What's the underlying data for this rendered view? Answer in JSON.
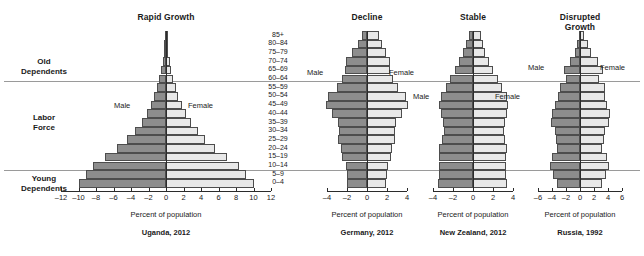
{
  "figure": {
    "age_groups": [
      "85+",
      "80–84",
      "75–79",
      "70–74",
      "65–69",
      "60–64",
      "55–59",
      "50–54",
      "45–49",
      "40–44",
      "35–39",
      "30–34",
      "25–29",
      "20–24",
      "15–19",
      "10–14",
      "5–9",
      "0–4"
    ],
    "side_labels": [
      {
        "name": "old-dependents",
        "text_line1": "Old",
        "text_line2": "Dependents"
      },
      {
        "name": "labor-force",
        "text_line1": "Labor",
        "text_line2": "Force"
      },
      {
        "name": "young-dependents",
        "text_line1": "Young",
        "text_line2": "Dependents"
      }
    ],
    "male_label": "Male",
    "female_label": "Female",
    "axis_title": "Percent of population",
    "colors": {
      "male": "#8d8d8d",
      "female": "#e8e8e8",
      "bar_border": "#4d4d4d",
      "axis": "#2b2b2b",
      "divider": "#9a9a9a"
    }
  },
  "chart_data": [
    {
      "type": "bar",
      "name": "uganda",
      "title": "Rapid Growth",
      "caption": "Uganda, 2012",
      "xlabel": "Percent of population",
      "ylabel": "",
      "categories": [
        "85+",
        "80–84",
        "75–79",
        "70–74",
        "65–69",
        "60–64",
        "55–59",
        "50–54",
        "45–49",
        "40–44",
        "35–39",
        "30–34",
        "25–29",
        "20–24",
        "15–19",
        "10–14",
        "5–9",
        "0–4"
      ],
      "xlim": [
        -12,
        12
      ],
      "xticks": [
        -12,
        -10,
        -8,
        -6,
        -4,
        -2,
        0,
        2,
        4,
        6,
        8,
        10,
        12
      ],
      "xticklabels": [
        "–12",
        "–10",
        "–8",
        "–6",
        "–4",
        "–2",
        "0",
        "2",
        "4",
        "6",
        "8",
        "10",
        "12"
      ],
      "grid": false,
      "legend": [
        "Male",
        "Female"
      ],
      "series": [
        {
          "name": "Male",
          "values": [
            0.12,
            0.18,
            0.26,
            0.38,
            0.55,
            0.78,
            1.05,
            1.35,
            1.75,
            2.2,
            2.8,
            3.55,
            4.45,
            5.6,
            6.95,
            8.3,
            9.1,
            10.0
          ]
        },
        {
          "name": "Female",
          "values": [
            0.14,
            0.2,
            0.28,
            0.4,
            0.58,
            0.82,
            1.1,
            1.4,
            1.8,
            2.25,
            2.85,
            3.6,
            4.5,
            5.65,
            7.0,
            8.35,
            9.15,
            10.05
          ]
        }
      ]
    },
    {
      "type": "bar",
      "name": "germany",
      "title": "Decline",
      "caption": "Germany, 2012",
      "xlabel": "Percent of population",
      "ylabel": "",
      "categories": [
        "85+",
        "80–84",
        "75–79",
        "70–74",
        "65–69",
        "60–64",
        "55–59",
        "50–54",
        "45–49",
        "40–44",
        "35–39",
        "30–34",
        "25–29",
        "20–24",
        "15–19",
        "10–14",
        "5–9",
        "0–4"
      ],
      "xlim": [
        -4,
        4
      ],
      "xticks": [
        -4,
        -2,
        0,
        2,
        4
      ],
      "xticklabels": [
        "–4",
        "–2",
        "0",
        "2",
        "4"
      ],
      "grid": false,
      "legend": [
        "Male",
        "Female"
      ],
      "series": [
        {
          "name": "Male",
          "values": [
            0.55,
            0.95,
            1.55,
            2.1,
            2.25,
            2.55,
            3.0,
            3.9,
            4.15,
            3.55,
            2.95,
            2.85,
            2.95,
            2.65,
            2.5,
            2.15,
            2.05,
            2.0
          ]
        },
        {
          "name": "Female",
          "values": [
            1.15,
            1.45,
            1.9,
            2.25,
            2.3,
            2.6,
            3.05,
            3.85,
            4.05,
            3.45,
            2.85,
            2.75,
            2.8,
            2.5,
            2.35,
            2.05,
            1.95,
            1.9
          ]
        }
      ]
    },
    {
      "type": "bar",
      "name": "new-zealand",
      "title": "Stable",
      "caption": "New Zealand, 2012",
      "xlabel": "Percent of population",
      "ylabel": "",
      "categories": [
        "85+",
        "80–84",
        "75–79",
        "70–74",
        "65–69",
        "60–64",
        "55–59",
        "50–54",
        "45–49",
        "40–44",
        "35–39",
        "30–34",
        "25–29",
        "20–24",
        "15–19",
        "10–14",
        "5–9",
        "0–4"
      ],
      "xlim": [
        -4,
        4
      ],
      "xticks": [
        -4,
        -2,
        0,
        2,
        4
      ],
      "xticklabels": [
        "–4",
        "–2",
        "0",
        "2",
        "4"
      ],
      "grid": false,
      "legend": [
        "Male",
        "Female"
      ],
      "series": [
        {
          "name": "Male",
          "values": [
            0.45,
            0.75,
            1.05,
            1.4,
            1.85,
            2.35,
            2.75,
            3.25,
            3.4,
            3.25,
            3.05,
            2.95,
            3.15,
            3.4,
            3.45,
            3.45,
            3.4,
            3.5
          ]
        },
        {
          "name": "Female",
          "values": [
            0.75,
            1.0,
            1.2,
            1.55,
            1.95,
            2.45,
            2.85,
            3.35,
            3.5,
            3.35,
            3.15,
            3.05,
            3.2,
            3.35,
            3.3,
            3.3,
            3.25,
            3.35
          ]
        }
      ]
    },
    {
      "type": "bar",
      "name": "russia",
      "title": "Disrupted Growth",
      "title_line1": "Disrupted",
      "title_line2": "Growth",
      "caption": "Russia, 1992",
      "xlabel": "Percent of population",
      "ylabel": "",
      "categories": [
        "85+",
        "80–84",
        "75–79",
        "70–74",
        "65–69",
        "60–64",
        "55–59",
        "50–54",
        "45–49",
        "40–44",
        "35–39",
        "30–34",
        "25–29",
        "20–24",
        "15–19",
        "10–14",
        "5–9",
        "0–4"
      ],
      "xlim": [
        -6,
        6
      ],
      "xticks": [
        -6,
        -4,
        -2,
        0,
        2,
        4,
        6
      ],
      "xticklabels": [
        "–6",
        "–4",
        "–2",
        "0",
        "2",
        "4",
        "6"
      ],
      "grid": false,
      "legend": [
        "Male",
        "Female"
      ],
      "series": [
        {
          "name": "Male",
          "values": [
            0.2,
            0.5,
            0.75,
            1.45,
            2.3,
            2.05,
            2.9,
            3.1,
            3.6,
            4.05,
            4.1,
            3.55,
            3.45,
            3.25,
            3.95,
            4.35,
            3.85,
            3.3
          ]
        },
        {
          "name": "Female",
          "values": [
            0.6,
            1.15,
            1.5,
            2.55,
            3.25,
            2.75,
            3.55,
            3.55,
            3.9,
            4.25,
            4.2,
            3.6,
            3.45,
            3.2,
            3.85,
            4.2,
            3.7,
            3.2
          ]
        }
      ]
    }
  ]
}
